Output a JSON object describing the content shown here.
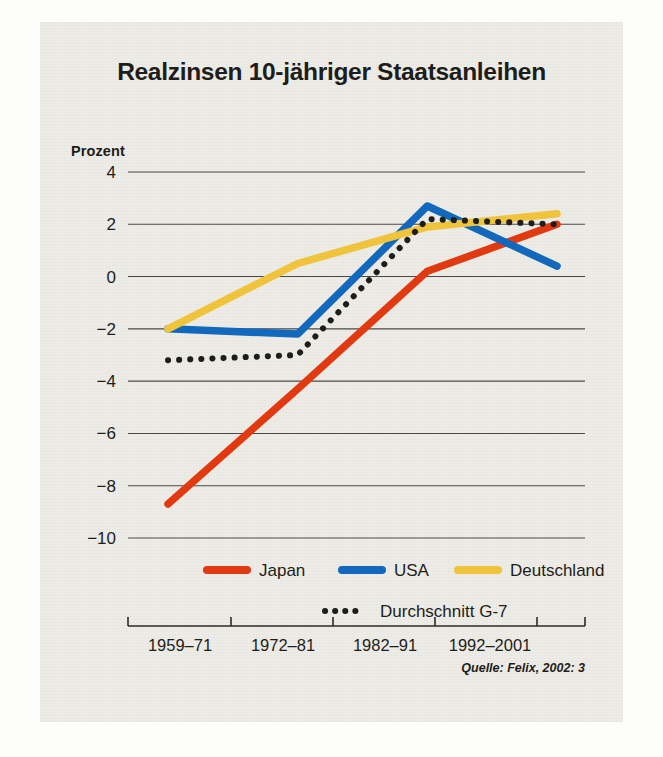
{
  "figure": {
    "title": "Realzinsen 10-jähriger Staatsanleihen",
    "y_axis_label": "Prozent",
    "source": "Quelle: Felix, 2002: 3"
  },
  "colors": {
    "japan": "#E33A11",
    "usa": "#1269BE",
    "deutschland": "#F2C53C",
    "g7": "#1d1d1b",
    "panel_background": "#eeece6",
    "page_background": "#fdfdfb",
    "gridline": "#4a4a48",
    "text": "#1d1d1b"
  },
  "legend": {
    "row1": [
      {
        "name": "legend-japan",
        "label": "Japan",
        "color": "#E33A11",
        "style": "solid"
      },
      {
        "name": "legend-usa",
        "label": "USA",
        "color": "#1269BE",
        "style": "solid"
      },
      {
        "name": "legend-deutschland",
        "label": "Deutschland",
        "color": "#F2C53C",
        "style": "solid"
      }
    ],
    "row2": [
      {
        "name": "legend-g7",
        "label": "Durchschnitt G-7",
        "color": "#1d1d1b",
        "style": "dotted"
      }
    ]
  },
  "chart_data": {
    "type": "line",
    "title": "Realzinsen 10-jähriger Staatsanleihen",
    "xlabel": "",
    "ylabel": "Prozent",
    "categories": [
      "1959–71",
      "1972–81",
      "1982–91",
      "1992–2001"
    ],
    "ytick_labels": [
      "4",
      "2",
      "0",
      "−2",
      "−4",
      "−6",
      "−8",
      "−10"
    ],
    "yticks": [
      4,
      2,
      0,
      -2,
      -4,
      -6,
      -8,
      -10
    ],
    "ylim": [
      -10,
      4
    ],
    "grid": true,
    "legend_position": "bottom",
    "series": [
      {
        "name": "Japan",
        "color": "#E33A11",
        "style": "solid",
        "values": [
          -8.7,
          -4.3,
          0.2,
          2.0
        ]
      },
      {
        "name": "USA",
        "color": "#1269BE",
        "style": "solid",
        "values": [
          -2.0,
          -2.2,
          2.7,
          0.4
        ]
      },
      {
        "name": "Deutschland",
        "color": "#F2C53C",
        "style": "solid",
        "values": [
          -2.0,
          0.5,
          1.9,
          2.4
        ]
      },
      {
        "name": "Durchschnitt G-7",
        "color": "#1d1d1b",
        "style": "dotted",
        "values": [
          -3.2,
          -3.0,
          2.2,
          2.0
        ]
      }
    ]
  },
  "ghost_page_text": {
    "right_block": "ebenfalls in eine\nStagnation, die\nauch die Wachs-\ntumsraten beein-\nträchtigte. Der\nRückgang der\nNachfrage nach\nKrediten und die\nZurückhaltung\nder Banken bei\nder Kreditver-\ngabe verstärkten\neinander."
  }
}
